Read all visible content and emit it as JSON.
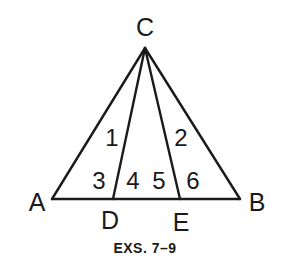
{
  "diagram": {
    "type": "triangle-with-cevians",
    "points": {
      "C": {
        "label": "C",
        "x": 145,
        "y": 48
      },
      "A": {
        "label": "A",
        "x": 52,
        "y": 199
      },
      "B": {
        "label": "B",
        "x": 240,
        "y": 199
      },
      "D": {
        "label": "D",
        "x": 113,
        "y": 199
      },
      "E": {
        "label": "E",
        "x": 180,
        "y": 199
      }
    },
    "segments": [
      [
        "C",
        "A"
      ],
      [
        "C",
        "B"
      ],
      [
        "A",
        "B"
      ],
      [
        "C",
        "D"
      ],
      [
        "C",
        "E"
      ]
    ],
    "angle_labels": [
      {
        "label": "1",
        "x": 112,
        "y": 146
      },
      {
        "label": "2",
        "x": 181,
        "y": 146
      },
      {
        "label": "3",
        "x": 99,
        "y": 189
      },
      {
        "label": "4",
        "x": 133,
        "y": 189
      },
      {
        "label": "5",
        "x": 159,
        "y": 189
      },
      {
        "label": "6",
        "x": 193,
        "y": 189
      }
    ],
    "caption": "EXS. 7–9",
    "colors": {
      "stroke": "#1a1a1a",
      "background": "#ffffff"
    }
  }
}
